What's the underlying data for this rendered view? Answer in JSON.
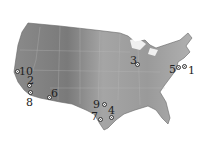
{
  "map": {
    "region": "Contiguous United States",
    "style": "grayscale shaded relief with state boundaries",
    "land_color": "#9a9a9a",
    "water_color": "#ffffff",
    "markers": [
      {
        "id": "1",
        "label": "1",
        "lx": 188,
        "ly": 65,
        "mx": 182,
        "my": 64
      },
      {
        "id": "2",
        "label": "2",
        "lx": 27,
        "ly": 75,
        "mx": 27,
        "my": 83
      },
      {
        "id": "3",
        "label": "3",
        "lx": 130,
        "ly": 55,
        "mx": 135,
        "my": 62
      },
      {
        "id": "4",
        "label": "4",
        "lx": 108,
        "ly": 105,
        "mx": 109,
        "my": 115
      },
      {
        "id": "5",
        "label": "5",
        "lx": 169,
        "ly": 64,
        "mx": 176,
        "my": 65
      },
      {
        "id": "6",
        "label": "6",
        "lx": 51,
        "ly": 88,
        "mx": 47,
        "my": 95
      },
      {
        "id": "7",
        "label": "7",
        "lx": 91,
        "ly": 111,
        "mx": 98,
        "my": 117
      },
      {
        "id": "8",
        "label": "8",
        "lx": 26,
        "ly": 97,
        "mx": 28,
        "my": 90
      },
      {
        "id": "9",
        "label": "9",
        "lx": 93,
        "ly": 99,
        "mx": 102,
        "my": 102
      },
      {
        "id": "10",
        "label": "10",
        "lx": 19,
        "ly": 66,
        "mx": 15,
        "my": 69
      }
    ]
  }
}
